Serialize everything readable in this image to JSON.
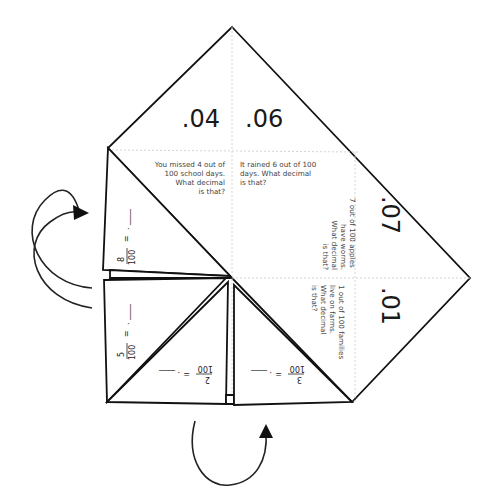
{
  "figure": {
    "top_flaps": [
      {
        "label": ".04"
      },
      {
        "label": ".06"
      }
    ],
    "right_flaps": [
      {
        "label": ".07"
      },
      {
        "label": ".01"
      }
    ],
    "questions": [
      {
        "lines": [
          "You missed 4 out of",
          "100 school days.",
          "What decimal",
          "is that?"
        ]
      },
      {
        "lines": [
          "It rained 6 out of 100",
          "days. What decimal",
          "is that?"
        ]
      },
      {
        "lines": [
          "7 out of 100 apples",
          "have worms.",
          "What decimal",
          "is that?"
        ]
      },
      {
        "lines": [
          "1 out of 100 families",
          "live on farms.",
          "What decimal",
          "is that?"
        ]
      }
    ],
    "fraction_flaps": [
      {
        "numerator": "8",
        "denominator": "100",
        "equals": "=",
        "blank": ". ____"
      },
      {
        "numerator": "5",
        "denominator": "100",
        "equals": "=",
        "blank": ". ____"
      },
      {
        "numerator": "2",
        "denominator": "100",
        "equals": "=",
        "blank": ". ____"
      },
      {
        "numerator": "3",
        "denominator": "100",
        "equals": "=",
        "blank": ". ____"
      }
    ],
    "arrows": [
      {
        "name": "left-fold-arrow",
        "direction": "clockwise-up"
      },
      {
        "name": "bottom-fold-arrow",
        "direction": "counterclockwise-up"
      }
    ],
    "colors": {
      "line": "#111111",
      "fold": "#cfcfcf",
      "text": "#1a1a1a"
    }
  }
}
